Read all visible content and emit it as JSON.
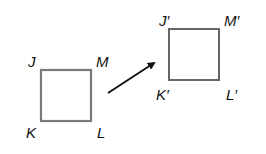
{
  "diagram": {
    "type": "translation",
    "colors": {
      "original_square": "#7a7a7a",
      "image_square": "#666666",
      "arrow": "#111111",
      "labels": "#111111"
    },
    "original": {
      "labels": {
        "top_left": "J",
        "top_right": "M",
        "bottom_left": "K",
        "bottom_right": "L"
      }
    },
    "image": {
      "labels": {
        "top_left": "J′",
        "top_right": "M′",
        "bottom_left": "K′",
        "bottom_right": "L′"
      }
    }
  }
}
